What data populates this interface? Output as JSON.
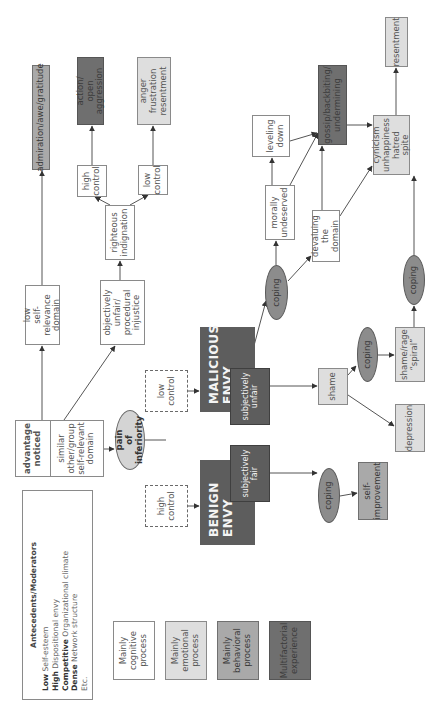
{
  "colors": {
    "cognitive": "#ffffff",
    "emotional": "#dedede",
    "behavioral": "#a9a9a9",
    "multifactorial": "#6f6f6f",
    "envy_box": "#5d5d5d",
    "coping_ellipse": "#8c8c8c",
    "pain_ellipse": "#d4d4d4"
  },
  "antecedents": {
    "title": "Antecedents/Moderators",
    "items": [
      {
        "level": "Low",
        "factor": "Self-esteem"
      },
      {
        "level": "High",
        "factor": "Dispositional envy"
      },
      {
        "level": "Competitive",
        "factor": "Organizational climate"
      },
      {
        "level": "Dense",
        "factor": "Network structure"
      },
      {
        "level": "",
        "factor": "Etc."
      }
    ]
  },
  "legend": [
    {
      "label": "Mainly\ncognitive\nprocess",
      "type": "cognitive"
    },
    {
      "label": "Mainly\nemotional\nprocess",
      "type": "emotional"
    },
    {
      "label": "Mainly\nbehavioral\nprocess",
      "type": "behavioral"
    },
    {
      "label": "Multifactorial\nexperience",
      "type": "multifactorial"
    }
  ],
  "nodes": {
    "advantage_noticed": "advantage\nnoticed",
    "similar_other": "similar\nother/group\nself-relevant\ndomain",
    "low_self_relevance": "low\nself-relevance\ndomain",
    "admiration": "admiration/awe/gratitude",
    "objectively_unfair": "objectively\nunfair/\nprocedural\ninjustice",
    "righteous_indignation": "righteous\nindignation",
    "high_control_top": "high\ncontrol",
    "low_control_top": "low\ncontrol",
    "action_aggression": "action/\nopen aggression",
    "anger_frustration": "anger\nfrustration\nresentment",
    "pain_of_inferiority": "pain\nof inferiority",
    "high_control_dashed": "high\ncontrol",
    "low_control_dashed": "low\ncontrol",
    "benign_envy": "BENIGN\nENVY",
    "subjectively_fair": "subjectively\nfair",
    "malicious_envy": "MALICIOUS\nENVY",
    "subjectively_unfair": "subjectively\nunfair",
    "coping_benign": "coping",
    "self_improvement": "self-\nimprovement",
    "coping_malicious": "coping",
    "morally_undeserved": "morally\nundeserved",
    "leveling_down": "leveling\ndown",
    "devaluing_domain": "devaluing the\ndomain",
    "gossip": "gossip/backbiting/\nundermining",
    "cynicism": "cynicism\nunhappiness\nhatred\nspite",
    "resentment": "resentment",
    "shame": "shame",
    "coping_shame": "coping",
    "shame_rage": "shame/rage\n“spiral”",
    "coping_spiral": "coping",
    "depression": "depression"
  }
}
